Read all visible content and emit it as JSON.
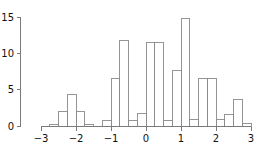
{
  "chart_data": {
    "type": "bar",
    "title": "",
    "subtitle": "",
    "xlabel": "",
    "ylabel": "",
    "grid": false,
    "legend": null,
    "bin_width": 0.25,
    "xlim": [
      -3.05,
      3.05
    ],
    "ylim": [
      0,
      15.6
    ],
    "xticks": [
      -3,
      -2,
      -1,
      0,
      1,
      2,
      3
    ],
    "xticklabels": [
      "−3",
      "−2",
      "−1",
      "0",
      "1",
      "2",
      "3"
    ],
    "yticks": [
      0,
      5,
      10,
      15
    ],
    "yticklabels": [
      "0",
      "5",
      "10",
      "15"
    ],
    "bin_edges": [
      -3.0,
      -2.75,
      -2.5,
      -2.25,
      -2.0,
      -1.75,
      -1.5,
      -1.25,
      -1.0,
      -0.75,
      -0.5,
      -0.25,
      0.0,
      0.25,
      0.5,
      0.75,
      1.0,
      1.25,
      1.5,
      1.75,
      2.0,
      2.25,
      2.5,
      2.75,
      3.0
    ],
    "categories": [
      "-3.00 to -2.75",
      "-2.75 to -2.50",
      "-2.50 to -2.25",
      "-2.25 to -2.00",
      "-2.00 to -1.75",
      "-1.75 to -1.50",
      "-1.50 to -1.25",
      "-1.25 to -1.00",
      "-1.00 to -0.75",
      "-0.75 to -0.50",
      "-0.50 to -0.25",
      "-0.25 to 0.00",
      "0.00 to 0.25",
      "0.25 to 0.50",
      "0.50 to 0.75",
      "0.75 to 1.00",
      "1.00 to 1.25",
      "1.25 to 1.50",
      "1.50 to 1.75",
      "1.75 to 2.00",
      "2.00 to 2.25",
      "2.25 to 2.50",
      "2.50 to 2.75",
      "2.75 to 3.00"
    ],
    "values": [
      0,
      0.2,
      2,
      4.3,
      2,
      0.2,
      0,
      0.7,
      6.5,
      11.8,
      0.8,
      1.7,
      11.5,
      11.5,
      0.7,
      7.6,
      14.8,
      0.9,
      6.6,
      6.6,
      0.9,
      1.6,
      3.7,
      0.4
    ],
    "values_right_tail": [
      0.4,
      0.9,
      0.9,
      0.3
    ],
    "bar_fill": "none",
    "bar_stroke": "#8a8a8a",
    "axis_color": "#7a7a7a",
    "background": "#ffffff"
  },
  "axes": {
    "x_tick_labels": [
      "−3",
      "−2",
      "−1",
      "0",
      "1",
      "2",
      "3"
    ],
    "y_tick_labels": [
      "0",
      "5",
      "10",
      "15"
    ]
  }
}
